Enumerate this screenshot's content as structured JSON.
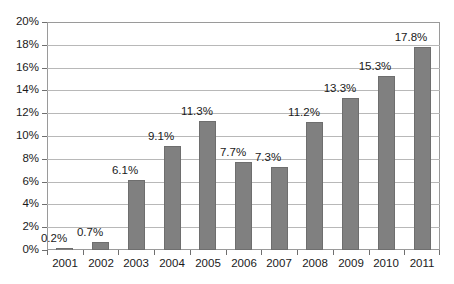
{
  "chart_data": {
    "type": "bar",
    "title": "",
    "subtitle": "",
    "xlabel": "",
    "ylabel": "",
    "categories": [
      "2001",
      "2002",
      "2003",
      "2004",
      "2005",
      "2006",
      "2007",
      "2008",
      "2009",
      "2010",
      "2011"
    ],
    "values": [
      0.2,
      0.7,
      6.1,
      9.1,
      11.3,
      7.7,
      7.3,
      11.2,
      13.3,
      15.3,
      17.8
    ],
    "data_labels": [
      "0.2%",
      "0.7%",
      "6.1%",
      "9.1%",
      "11.3%",
      "7.7%",
      "7.3%",
      "11.2%",
      "13.3%",
      "15.3%",
      "17.8%"
    ],
    "ylim": [
      0,
      20
    ],
    "ytick_values": [
      0,
      2,
      4,
      6,
      8,
      10,
      12,
      14,
      16,
      18,
      20
    ],
    "ytick_labels": [
      "0%",
      "2%",
      "4%",
      "6%",
      "8%",
      "10%",
      "12%",
      "14%",
      "16%",
      "18%",
      "20%"
    ],
    "grid": true,
    "legend": false,
    "legend_position": "none",
    "series_color": "#808080",
    "gridline_color": "#b8b8b8",
    "axis_color": "#9a9a9a",
    "text_color": "#1a1a1a",
    "background_color": "#ffffff"
  }
}
